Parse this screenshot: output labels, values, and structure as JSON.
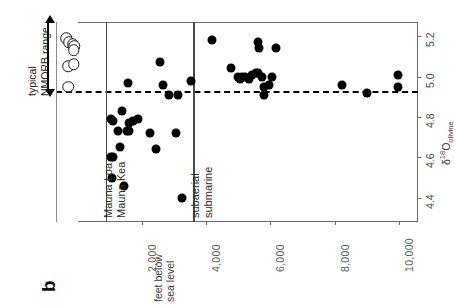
{
  "panel": {
    "label": "b"
  },
  "axes": {
    "depth": {
      "title_line1": "feet below",
      "title_line2": "sea level",
      "ticks": [
        {
          "value": 2000,
          "label": "2,000"
        },
        {
          "value": 4000,
          "label": "4,000"
        },
        {
          "value": 6000,
          "label": "6,000"
        },
        {
          "value": 8000,
          "label": "8,000"
        },
        {
          "value": 10000,
          "label": "10,000"
        }
      ],
      "range": [
        0,
        10600
      ]
    },
    "d18O": {
      "title_delta": "δ",
      "title_sup": "18",
      "title_O": "O",
      "title_sub": "olivine",
      "ticks": [
        {
          "value": 5.2,
          "label": "5.2"
        },
        {
          "value": 5.0,
          "label": "5.0"
        },
        {
          "value": 4.8,
          "label": "4.8"
        },
        {
          "value": 4.6,
          "label": "4.6"
        },
        {
          "value": 4.4,
          "label": "4.4"
        }
      ],
      "range": [
        4.28,
        5.27
      ]
    }
  },
  "annotations": {
    "nmorb_line1": "typical",
    "nmorb_line2": "NMORB range",
    "nmorb_top": 5.27,
    "nmorb_bottom": 4.93,
    "reference_line_value": 4.93,
    "dividers": [
      {
        "name": "volcano-divider",
        "depth": 870,
        "left_label": "Mauna Loa",
        "right_label": "Mauna Kea"
      },
      {
        "name": "eruption-divider",
        "depth": 3600,
        "left_label": "subaerial",
        "right_label": "submarine"
      }
    ]
  },
  "chart_data": {
    "type": "scatter",
    "title": "",
    "xlabel": "feet below sea level",
    "ylabel": "δ18O olivine",
    "xlim": [
      0,
      10600
    ],
    "ylim": [
      4.28,
      5.27
    ],
    "grid": false,
    "legend": "none",
    "orientation": "rotated-90",
    "reference_line": {
      "y": 4.93,
      "style": "dashed"
    },
    "series": [
      {
        "name": "NMORB reference (open circles)",
        "marker": "open-circle",
        "points": [
          {
            "x": -360,
            "y": 5.19
          },
          {
            "x": -290,
            "y": 5.17
          },
          {
            "x": -170,
            "y": 5.16
          },
          {
            "x": -110,
            "y": 5.15
          },
          {
            "x": -130,
            "y": 5.13
          },
          {
            "x": -310,
            "y": 5.05
          },
          {
            "x": -140,
            "y": 5.06
          },
          {
            "x": -300,
            "y": 4.95
          }
        ]
      },
      {
        "name": "Hawaiian basalt olivine (filled circles)",
        "marker": "filled-circle",
        "points": [
          {
            "x": 1020,
            "y": 4.79
          },
          {
            "x": 1080,
            "y": 4.78
          },
          {
            "x": 1020,
            "y": 4.6
          },
          {
            "x": 1090,
            "y": 4.6
          },
          {
            "x": 1060,
            "y": 4.5
          },
          {
            "x": 1310,
            "y": 4.65
          },
          {
            "x": 1240,
            "y": 4.73
          },
          {
            "x": 1370,
            "y": 4.83
          },
          {
            "x": 1420,
            "y": 4.46
          },
          {
            "x": 1520,
            "y": 4.73
          },
          {
            "x": 1600,
            "y": 4.73
          },
          {
            "x": 1600,
            "y": 4.77
          },
          {
            "x": 1700,
            "y": 4.78
          },
          {
            "x": 1560,
            "y": 4.97
          },
          {
            "x": 1880,
            "y": 4.79
          },
          {
            "x": 2240,
            "y": 4.72
          },
          {
            "x": 2430,
            "y": 4.64
          },
          {
            "x": 2560,
            "y": 5.07
          },
          {
            "x": 2640,
            "y": 4.96
          },
          {
            "x": 2840,
            "y": 4.91
          },
          {
            "x": 3070,
            "y": 4.72
          },
          {
            "x": 3120,
            "y": 4.91
          },
          {
            "x": 3250,
            "y": 4.4
          },
          {
            "x": 3530,
            "y": 4.98
          },
          {
            "x": 4180,
            "y": 5.18
          },
          {
            "x": 4780,
            "y": 5.04
          },
          {
            "x": 4990,
            "y": 5.0
          },
          {
            "x": 5060,
            "y": 4.99
          },
          {
            "x": 5120,
            "y": 5.0
          },
          {
            "x": 5200,
            "y": 5.0
          },
          {
            "x": 5340,
            "y": 4.99
          },
          {
            "x": 5440,
            "y": 5.01
          },
          {
            "x": 5560,
            "y": 5.02
          },
          {
            "x": 5610,
            "y": 5.02
          },
          {
            "x": 5620,
            "y": 5.17
          },
          {
            "x": 5630,
            "y": 5.14
          },
          {
            "x": 5730,
            "y": 5.0
          },
          {
            "x": 5800,
            "y": 4.95
          },
          {
            "x": 5810,
            "y": 4.91
          },
          {
            "x": 5950,
            "y": 4.96
          },
          {
            "x": 6060,
            "y": 5.0
          },
          {
            "x": 6160,
            "y": 5.14
          },
          {
            "x": 8230,
            "y": 4.96
          },
          {
            "x": 9010,
            "y": 4.92
          },
          {
            "x": 9980,
            "y": 5.01
          },
          {
            "x": 9990,
            "y": 4.95
          }
        ]
      }
    ]
  }
}
